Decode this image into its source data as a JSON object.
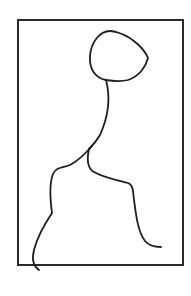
{
  "figure": {
    "colors": {
      "background": "#ffffff",
      "stroke": "#1e1e1e",
      "frame": "#2a2a2a"
    }
  }
}
